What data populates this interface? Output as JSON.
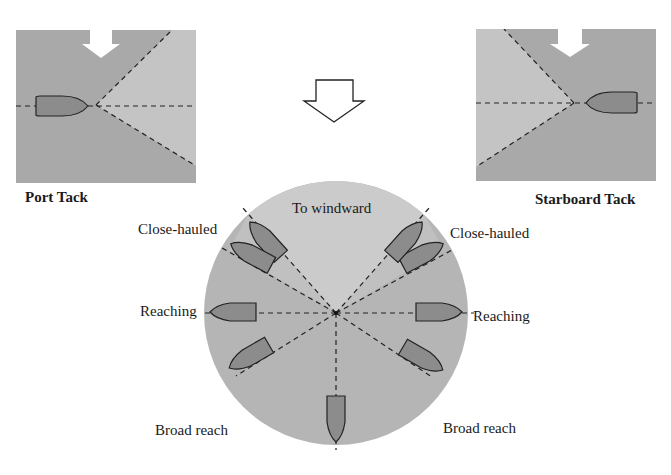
{
  "colors": {
    "background": "#ffffff",
    "panel_dark": "#a9a9a9",
    "panel_light": "#c4c4c4",
    "circle_outer": "#b5b5b5",
    "circle_windward": "#cbcbcb",
    "boat_fill": "#8c8c8c",
    "stroke": "#222222",
    "arrow_fill": "#ffffff"
  },
  "panels": {
    "port": {
      "label": "Port Tack"
    },
    "starboard": {
      "label": "Starboard Tack"
    }
  },
  "transition_arrow": {
    "icon": "hollow-down-arrow-icon"
  },
  "wind_arrows": {
    "icon": "wind-direction-arrow-icon"
  },
  "points_of_sail": {
    "windward": "To windward",
    "close_hauled_left": "Close-hauled",
    "close_hauled_right": "Close-hauled",
    "reaching_left": "Reaching",
    "reaching_right": "Reaching",
    "broad_reach_left": "Broad reach",
    "broad_reach_right": "Broad reach"
  }
}
